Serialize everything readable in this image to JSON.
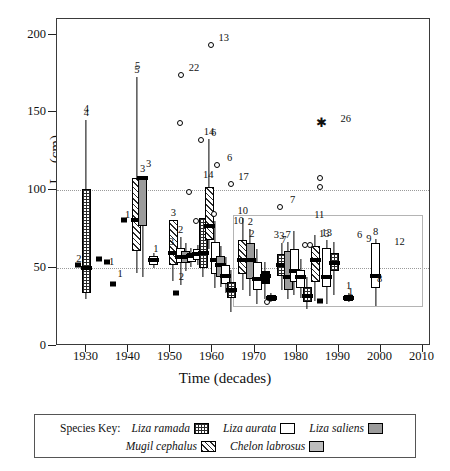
{
  "chart_data": {
    "type": "box",
    "title": "",
    "xlabel": "Time (decades)",
    "ylabel": "L∞ (cm)",
    "ylim": [
      0,
      210
    ],
    "xlim": [
      1923,
      2012
    ],
    "yticks": [
      0,
      50,
      100,
      150,
      200
    ],
    "xticks": [
      1930,
      1940,
      1950,
      1960,
      1970,
      1980,
      1990,
      2000,
      2010
    ],
    "grid": "horizontal dotted at 50 and 100",
    "legend_position": "below-axes",
    "reference_box": {
      "x0": 1965,
      "x1": 2010,
      "y0": 25,
      "y1": 84
    },
    "series": [
      {
        "name": "Liza ramada",
        "pattern": "grid-hatch",
        "key": "ramada"
      },
      {
        "name": "Liza aurata",
        "pattern": "open-white",
        "key": "aurata"
      },
      {
        "name": "Liza saliens",
        "pattern": "grey-fill",
        "key": "saliens"
      },
      {
        "name": "Mugil cephalus",
        "pattern": "diagonal-hatch",
        "key": "cephalus"
      },
      {
        "name": "Chelon labrosus",
        "pattern": "light-grey-fill",
        "key": "labrosus"
      }
    ],
    "boxes": [
      {
        "x": 1930.0,
        "species": "ramada",
        "low": 30,
        "q1": 34,
        "med": 50,
        "q3": 101,
        "high": 145,
        "n": "4"
      },
      {
        "x": 1942.0,
        "species": "cephalus",
        "low": 47,
        "q1": 61,
        "med": 81,
        "q3": 108,
        "high": 173,
        "n": "5"
      },
      {
        "x": 1943.4,
        "species": "saliens",
        "low": 44,
        "q1": 77,
        "med": 108,
        "q3": 109,
        "high": 109,
        "n": "3"
      },
      {
        "x": 1946.0,
        "species": "aurata",
        "low": 50,
        "q1": 52,
        "med": 55,
        "q3": 58,
        "high": 60,
        "n": ""
      },
      {
        "x": 1950.7,
        "species": "cephalus",
        "low": 42,
        "q1": 52,
        "med": 60,
        "q3": 81,
        "high": 81,
        "n": "3"
      },
      {
        "x": 1952.4,
        "species": "aurata",
        "low": 39,
        "q1": 53,
        "med": 57,
        "q3": 63,
        "high": 70,
        "n": "2"
      },
      {
        "x": 1953.6,
        "species": "saliens",
        "low": 48,
        "q1": 53,
        "med": 57,
        "q3": 61,
        "high": 66,
        "n": ""
      },
      {
        "x": 1955.0,
        "species": "aurata",
        "low": 51,
        "q1": 54,
        "med": 58,
        "q3": 60,
        "high": 63,
        "n": ""
      },
      {
        "x": 1956.5,
        "species": "aurata",
        "low": 52,
        "q1": 55,
        "med": 59,
        "q3": 62,
        "high": 65,
        "n": ""
      },
      {
        "x": 1957.8,
        "species": "ramada",
        "low": 44,
        "q1": 50,
        "med": 60,
        "q3": 82,
        "high": 82,
        "n": ""
      },
      {
        "x": 1959.2,
        "species": "cephalus",
        "low": 62,
        "q1": 68,
        "med": 77,
        "q3": 102,
        "high": 133,
        "n": "14"
      },
      {
        "x": 1960.6,
        "species": "aurata",
        "low": 37,
        "q1": 46,
        "med": 55,
        "q3": 67,
        "high": 80,
        "n": ""
      },
      {
        "x": 1962.0,
        "species": "saliens",
        "low": 38,
        "q1": 44,
        "med": 52,
        "q3": 58,
        "high": 64,
        "n": ""
      },
      {
        "x": 1963.2,
        "species": "aurata",
        "low": 34,
        "q1": 40,
        "med": 45,
        "q3": 52,
        "high": 57,
        "n": ""
      },
      {
        "x": 1964.5,
        "species": "ramada",
        "low": 22,
        "q1": 31,
        "med": 36,
        "q3": 41,
        "high": 49,
        "n": ""
      },
      {
        "x": 1967.2,
        "species": "cephalus",
        "low": 36,
        "q1": 46,
        "med": 55,
        "q3": 68,
        "high": 82,
        "n": "10"
      },
      {
        "x": 1969.0,
        "species": "saliens",
        "low": 32,
        "q1": 43,
        "med": 55,
        "q3": 66,
        "high": 75,
        "n": "2"
      },
      {
        "x": 1970.6,
        "species": "aurata",
        "low": 27,
        "q1": 36,
        "med": 43,
        "q3": 54,
        "high": 62,
        "n": ""
      },
      {
        "x": 1972.5,
        "species": "solid",
        "low": 30,
        "q1": 40,
        "med": 45,
        "q3": 48,
        "high": 54,
        "n": ""
      },
      {
        "x": 1974.0,
        "species": "solid",
        "low": 28,
        "q1": 29,
        "med": 31,
        "q3": 33,
        "high": 34,
        "n": ""
      },
      {
        "x": 1976.5,
        "species": "ramada",
        "low": 36,
        "q1": 45,
        "med": 52,
        "q3": 59,
        "high": 66,
        "n": "3"
      },
      {
        "x": 1978.0,
        "species": "saliens",
        "low": 30,
        "q1": 36,
        "med": 44,
        "q3": 61,
        "high": 67,
        "n": "7"
      },
      {
        "x": 1979.4,
        "species": "aurata",
        "low": 33,
        "q1": 41,
        "med": 48,
        "q3": 62,
        "high": 74,
        "n": ""
      },
      {
        "x": 1981.0,
        "species": "aurata",
        "low": 31,
        "q1": 37,
        "med": 44,
        "q3": 49,
        "high": 56,
        "n": ""
      },
      {
        "x": 1982.6,
        "species": "ramada",
        "low": 24,
        "q1": 28,
        "med": 32,
        "q3": 38,
        "high": 44,
        "n": ""
      },
      {
        "x": 1984.4,
        "species": "cephalus",
        "low": 29,
        "q1": 41,
        "med": 55,
        "q3": 64,
        "high": 71,
        "n": ""
      },
      {
        "x": 1987.2,
        "species": "aurata",
        "low": 27,
        "q1": 38,
        "med": 44,
        "q3": 63,
        "high": 68,
        "n": "13"
      },
      {
        "x": 1989.0,
        "species": "ramada",
        "low": 33,
        "q1": 48,
        "med": 53,
        "q3": 60,
        "high": 67,
        "n": ""
      },
      {
        "x": 1992.4,
        "species": "solid",
        "low": 28,
        "q1": 29,
        "med": 31,
        "q3": 33,
        "high": 34,
        "n": "1"
      },
      {
        "x": 1998.8,
        "species": "aurata",
        "low": 26,
        "q1": 37,
        "med": 45,
        "q3": 66,
        "high": 69,
        "n": "8"
      }
    ],
    "points_open": [
      {
        "x": 1959.6,
        "y": 193,
        "n": "13"
      },
      {
        "x": 1952.5,
        "y": 174,
        "n": "22"
      },
      {
        "x": 1952.2,
        "y": 143,
        "n": ""
      },
      {
        "x": 1957.2,
        "y": 132,
        "n": "6"
      },
      {
        "x": 1961.0,
        "y": 116,
        "n": "6"
      },
      {
        "x": 1964.3,
        "y": 104,
        "n": "17"
      },
      {
        "x": 1954.4,
        "y": 99,
        "n": ""
      },
      {
        "x": 1976.0,
        "y": 89,
        "n": "7"
      },
      {
        "x": 1985.7,
        "y": 108,
        "n": ""
      },
      {
        "x": 1985.6,
        "y": 102,
        "n": ""
      },
      {
        "x": 1956.0,
        "y": 80,
        "n": ""
      },
      {
        "x": 1960.3,
        "y": 85,
        "n": ""
      },
      {
        "x": 1973.0,
        "y": 28,
        "n": ""
      },
      {
        "x": 1982.0,
        "y": 65,
        "n": ""
      },
      {
        "x": 1983.2,
        "y": 65,
        "n": ""
      }
    ],
    "points_filled": [
      {
        "x": 1928.0,
        "y": 52,
        "n": "2"
      },
      {
        "x": 1933.0,
        "y": 56,
        "n": "2"
      },
      {
        "x": 1934.8,
        "y": 54,
        "n": "1"
      },
      {
        "x": 1936.3,
        "y": 40,
        "n": "1"
      },
      {
        "x": 1939.0,
        "y": 81,
        "n": "1"
      },
      {
        "x": 1951.2,
        "y": 34,
        "n": "2"
      },
      {
        "x": 1973.8,
        "y": 31,
        "n": ""
      },
      {
        "x": 1985.6,
        "y": 29,
        "n": ""
      }
    ],
    "points_star": [
      {
        "x": 1986.0,
        "y": 143,
        "n": "26"
      }
    ],
    "free_labels": [
      {
        "x": 1930.0,
        "y": 152,
        "text": "4"
      },
      {
        "x": 1942.2,
        "y": 180,
        "text": "5"
      },
      {
        "x": 1944.8,
        "y": 117,
        "text": "3"
      },
      {
        "x": 1950.2,
        "y": 67,
        "text": "3"
      },
      {
        "x": 1952.6,
        "y": 44,
        "text": "2"
      },
      {
        "x": 1959.0,
        "y": 110,
        "text": "14"
      },
      {
        "x": 1966.2,
        "y": 80,
        "text": "10"
      },
      {
        "x": 1969.4,
        "y": 72,
        "text": "2"
      },
      {
        "x": 1975.2,
        "y": 71,
        "text": "3"
      },
      {
        "x": 1977.0,
        "y": 68,
        "text": "7"
      },
      {
        "x": 1984.2,
        "y": 73,
        "text": ""
      },
      {
        "x": 1986.6,
        "y": 72,
        "text": "13"
      },
      {
        "x": 1985.4,
        "y": 84,
        "text": "11"
      },
      {
        "x": 1995.0,
        "y": 71,
        "text": "6"
      },
      {
        "x": 1997.2,
        "y": 69,
        "text": "9"
      },
      {
        "x": 2004.5,
        "y": 67,
        "text": "12"
      },
      {
        "x": 1999.8,
        "y": 43,
        "text": "8"
      },
      {
        "x": 1992.9,
        "y": 35,
        "text": "1"
      },
      {
        "x": 1946.5,
        "y": 62,
        "text": "1"
      },
      {
        "x": 1939.8,
        "y": 84,
        "text": "1"
      },
      {
        "x": 1936.0,
        "y": 54,
        "text": "1"
      },
      {
        "x": 1938.0,
        "y": 46,
        "text": "1"
      },
      {
        "x": 1928.2,
        "y": 56,
        "text": "2"
      }
    ]
  },
  "legend": {
    "key_label": "Species Key:",
    "row1": [
      {
        "name": "Liza ramada",
        "swatch": "ramada"
      },
      {
        "name": "Liza aurata",
        "swatch": "aurata"
      },
      {
        "name": "Liza saliens",
        "swatch": "saliens"
      }
    ],
    "row2": [
      {
        "name": "Mugil cephalus",
        "swatch": "cephalus"
      },
      {
        "name": "Chelon labrosus",
        "swatch": "labrosus"
      }
    ]
  },
  "caption": ""
}
